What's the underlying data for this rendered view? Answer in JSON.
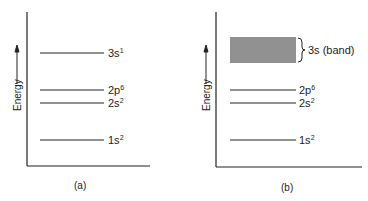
{
  "panels": [
    {
      "caption": "(a)",
      "axis_label": "Energy",
      "levels": [
        {
          "main": "3s",
          "sup": "1"
        },
        {
          "main": "2p",
          "sup": "6"
        },
        {
          "main": "2s",
          "sup": "2"
        },
        {
          "main": "1s",
          "sup": "2"
        }
      ]
    },
    {
      "caption": "(b)",
      "axis_label": "Energy",
      "band_label": "3s (band)",
      "levels": [
        {
          "main": "2p",
          "sup": "6"
        },
        {
          "main": "2s",
          "sup": "2"
        },
        {
          "main": "1s",
          "sup": "2"
        }
      ]
    }
  ]
}
